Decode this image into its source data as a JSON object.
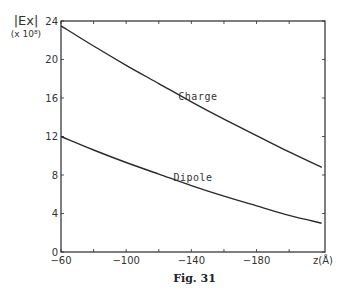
{
  "figure": {
    "caption": "Fig. 31",
    "y_axis_label_main": "|Ex|",
    "y_axis_label_multiplier": "(x 10⁸)",
    "x_axis_unit_label": "z(Å)"
  },
  "chart_data": {
    "type": "line",
    "title": "",
    "xlabel": "z (Å)",
    "ylabel": "|Ex| (x 10^8)",
    "xlim": [
      -60,
      -222
    ],
    "ylim": [
      0,
      24
    ],
    "x_ticks": [
      -60,
      -80,
      -100,
      -120,
      -140,
      -160,
      -180,
      -200
    ],
    "x_tick_labels": [
      "-60",
      "",
      "-100",
      "",
      "-140",
      "",
      "-180",
      ""
    ],
    "y_ticks": [
      0,
      4,
      8,
      12,
      16,
      20,
      24
    ],
    "y_tick_labels": [
      "0",
      "4",
      "8",
      "12",
      "16",
      "20",
      "24"
    ],
    "grid": false,
    "legend": "inline labels on curves",
    "x": [
      -60,
      -80,
      -100,
      -120,
      -140,
      -160,
      -180,
      -200,
      -220
    ],
    "series": [
      {
        "name": "Charge",
        "values": [
          23.5,
          21.4,
          19.4,
          17.5,
          15.6,
          13.8,
          12.1,
          10.4,
          8.8
        ],
        "label_pos": [
          -132,
          15.8
        ]
      },
      {
        "name": "Dipole",
        "values": [
          12.0,
          10.6,
          9.3,
          8.1,
          6.9,
          5.8,
          4.8,
          3.8,
          3.0
        ],
        "label_pos": [
          -129,
          7.4
        ]
      }
    ],
    "line_color": "#2a2a2a"
  }
}
